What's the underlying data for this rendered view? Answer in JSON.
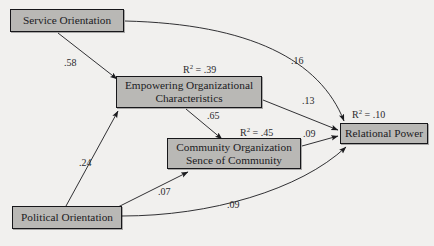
{
  "diagram": {
    "type": "path-model",
    "background_color": "#f1f0ee",
    "node_fill_color": "#b9b8b5",
    "node_border_color": "#17171a",
    "nodes": [
      {
        "id": "service",
        "label": "Service Orientation"
      },
      {
        "id": "empower",
        "label": "Empowering Organizational\nCharacteristics"
      },
      {
        "id": "community",
        "label": "Community Organization\nSence of Community"
      },
      {
        "id": "relational",
        "label": "Relational Power"
      },
      {
        "id": "political",
        "label": "Political Orientation"
      }
    ],
    "paths": [
      {
        "from": "service",
        "to": "empower",
        "coefficient": ".58",
        "shape": "straight"
      },
      {
        "from": "service",
        "to": "relational",
        "coefficient": ".16",
        "shape": "curved"
      },
      {
        "from": "empower",
        "to": "relational",
        "coefficient": ".13",
        "shape": "straight"
      },
      {
        "from": "empower",
        "to": "community",
        "coefficient": ".65",
        "shape": "straight"
      },
      {
        "from": "community",
        "to": "relational",
        "coefficient": ".09",
        "shape": "straight"
      },
      {
        "from": "political",
        "to": "empower",
        "coefficient": ".24",
        "shape": "straight"
      },
      {
        "from": "political",
        "to": "community",
        "coefficient": ".07",
        "shape": "straight"
      },
      {
        "from": "political",
        "to": "relational",
        "coefficient": ".09",
        "shape": "curved"
      }
    ],
    "r_squared": [
      {
        "node": "empower",
        "symbol": "R",
        "exponent": "2",
        "equals": " = ",
        "value": ".39"
      },
      {
        "node": "community",
        "symbol": "R",
        "exponent": "2",
        "equals": " = ",
        "value": ".45"
      },
      {
        "node": "relational",
        "symbol": "R",
        "exponent": "2",
        "equals": " = ",
        "value": ".10"
      }
    ]
  }
}
